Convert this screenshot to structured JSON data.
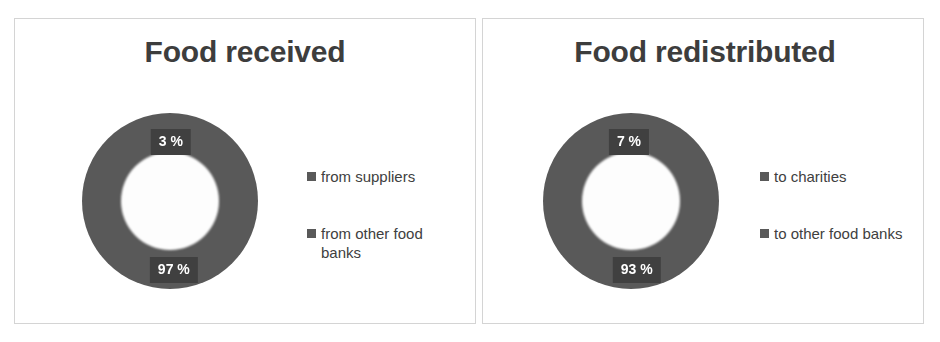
{
  "charts": [
    {
      "title": "Food received",
      "labels": {
        "small": "3 %",
        "large": "97 %"
      },
      "legend": [
        {
          "label": "from suppliers",
          "swatch": "legend-swatch-icon"
        },
        {
          "label": "from other food banks",
          "swatch": "legend-swatch-icon"
        }
      ]
    },
    {
      "title": "Food redistributed",
      "labels": {
        "small": "7 %",
        "large": "93 %"
      },
      "legend": [
        {
          "label": "to charities",
          "swatch": "legend-swatch-icon"
        },
        {
          "label": "to other food banks",
          "swatch": "legend-swatch-icon"
        }
      ]
    }
  ],
  "colors": {
    "slice": "#595959",
    "label_box": "#404040",
    "label_text": "#ffffff",
    "title_text": "#3d3d3d",
    "legend_text": "#404040",
    "panel_border": "#d4d4d4",
    "background": "#ffffff"
  },
  "chart_data": [
    {
      "type": "pie",
      "variant": "doughnut",
      "title": "Food received",
      "categories": [
        "from suppliers",
        "from other food banks"
      ],
      "values": [
        3,
        97
      ],
      "data_labels": [
        "3 %",
        "97 %"
      ],
      "units": "percent",
      "colors": [
        "#595959",
        "#595959"
      ],
      "legend_position": "right",
      "grid": false,
      "hole_ratio": 0.56,
      "start_angle": 0,
      "xlabel": "",
      "ylabel": ""
    },
    {
      "type": "pie",
      "variant": "doughnut",
      "title": "Food redistributed",
      "categories": [
        "to charities",
        "to other food banks"
      ],
      "values": [
        7,
        93
      ],
      "data_labels": [
        "7 %",
        "93 %"
      ],
      "units": "percent",
      "colors": [
        "#595959",
        "#595959"
      ],
      "legend_position": "right",
      "grid": false,
      "hole_ratio": 0.56,
      "start_angle": 0,
      "xlabel": "",
      "ylabel": ""
    }
  ]
}
